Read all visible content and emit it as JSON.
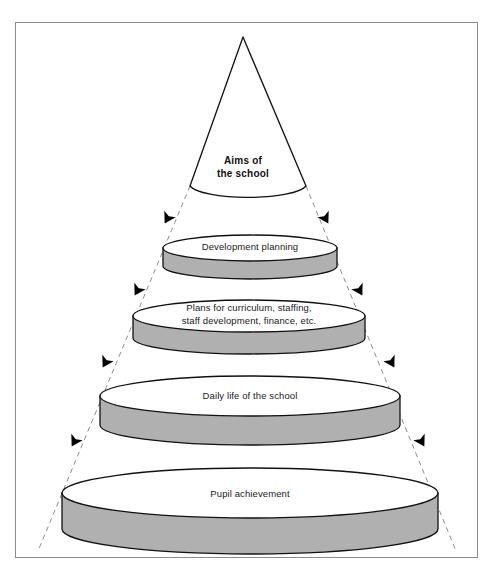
{
  "figure": {
    "background_color": "#ffffff",
    "frame_border_color": "#8c8c8c",
    "outline_color": "#111111",
    "disc_side_fill": "#b0b0b0",
    "disc_top_fill": "#ffffff",
    "dashed_line_color": "#8d8d8d",
    "arrow_color": "#000000",
    "apex": {
      "label": "Aims of\nthe school",
      "bold": true
    },
    "levels": [
      {
        "id": "development-planning",
        "label": "Development planning",
        "cx": 250,
        "cy": 248,
        "rx": 87,
        "ry": 13,
        "depth": 18
      },
      {
        "id": "plans-for-curriculum",
        "label": "Plans for curriculum, staffing,\nstaff development, finance, etc.",
        "cx": 249,
        "cy": 316,
        "rx": 116,
        "ry": 16,
        "depth": 22
      },
      {
        "id": "daily-life-of-the-school",
        "label": "Daily life of the school",
        "cx": 250,
        "cy": 396,
        "rx": 150,
        "ry": 20,
        "depth": 29
      },
      {
        "id": "pupil-achievement",
        "label": "Pupil achievement",
        "cx": 250,
        "cy": 493,
        "rx": 188,
        "ry": 25,
        "depth": 36
      }
    ],
    "arrows": [
      {
        "id": "left-arrow-1",
        "x": 170,
        "y": 214,
        "angle": 119
      },
      {
        "id": "right-arrow-1",
        "x": 323,
        "y": 214,
        "angle": 61
      },
      {
        "id": "left-arrow-2",
        "x": 140,
        "y": 286,
        "angle": 119
      },
      {
        "id": "right-arrow-2",
        "x": 357,
        "y": 286,
        "angle": 61
      },
      {
        "id": "left-arrow-3",
        "x": 108,
        "y": 358,
        "angle": 119
      },
      {
        "id": "right-arrow-3",
        "x": 389,
        "y": 358,
        "angle": 61
      },
      {
        "id": "left-arrow-4",
        "x": 77,
        "y": 437,
        "angle": 119
      },
      {
        "id": "right-arrow-4",
        "x": 419,
        "y": 437,
        "angle": 61
      }
    ],
    "dashed_guides": [
      {
        "id": "left-guide",
        "x1": 190,
        "y1": 186,
        "x2": 38,
        "y2": 551
      },
      {
        "id": "right-guide",
        "x1": 306,
        "y1": 186,
        "x2": 456,
        "y2": 551
      }
    ]
  }
}
